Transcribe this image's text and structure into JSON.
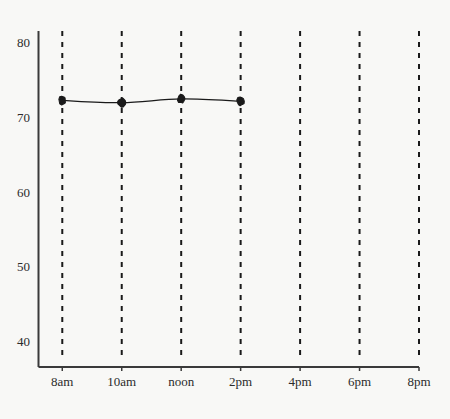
{
  "chart_data": {
    "type": "line",
    "title": "",
    "subtitle": "",
    "xlabel": "",
    "ylabel": "",
    "x_tick_labels": [
      "8am",
      "10am",
      "noon",
      "2pm",
      "4pm",
      "6pm",
      "8pm"
    ],
    "x_tick_values": [
      8,
      10,
      12,
      14,
      16,
      18,
      20
    ],
    "y_tick_labels": [
      "40",
      "50",
      "60",
      "70",
      "80"
    ],
    "y_tick_values": [
      40,
      50,
      60,
      70,
      80
    ],
    "xlim": [
      7.2,
      20
    ],
    "ylim": [
      36.5,
      81.5
    ],
    "grid": {
      "vertical": true,
      "horizontal": false,
      "style": "dashed",
      "color": "#1a1a1a"
    },
    "legend": {
      "visible": false,
      "position": "none"
    },
    "series": [
      {
        "name": "temperature",
        "marker": "filled-blob",
        "marker_color": "#1a1a1a",
        "line_color": "#1a1a1a",
        "x": [
          8,
          10,
          12,
          14
        ],
        "x_labels": [
          "8am",
          "10am",
          "noon",
          "2pm"
        ],
        "values": [
          72.2,
          71.9,
          72.4,
          72.1
        ]
      }
    ],
    "axis_color": "#3a3a3a",
    "background_color": "#f8f8f6"
  }
}
